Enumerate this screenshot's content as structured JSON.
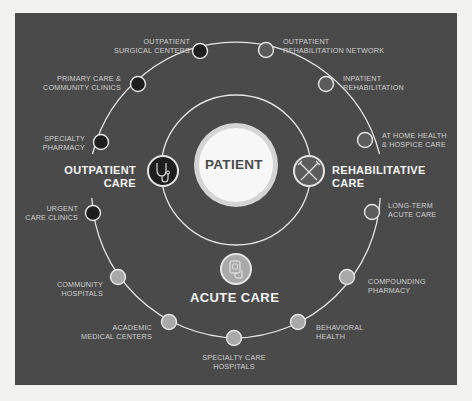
{
  "diagram": {
    "center": {
      "label": "PATIENT"
    },
    "categories": {
      "outpatient": {
        "line1": "OUTPATIENT",
        "line2": "CARE",
        "icon": "stethoscope-icon"
      },
      "rehabilitative": {
        "line1": "REHABILITATIVE",
        "line2": "CARE",
        "icon": "crutches-icon"
      },
      "acute": {
        "label": "ACUTE CARE",
        "icon": "iv-bag-icon"
      }
    },
    "nodes": [
      {
        "line1": "OUTPATIENT",
        "line2": "SURGICAL CENTERS",
        "group": "outpatient"
      },
      {
        "line1": "PRIMARY CARE &",
        "line2": "COMMUNITY CLINICS",
        "group": "outpatient"
      },
      {
        "line1": "SPECIALTY",
        "line2": "PHARMACY",
        "group": "outpatient"
      },
      {
        "line1": "URGENT",
        "line2": "CARE CLINICS",
        "group": "outpatient"
      },
      {
        "line1": "OUTPATIENT",
        "line2": "REHABILITATION NETWORK",
        "group": "rehabilitative"
      },
      {
        "line1": "INPATIENT",
        "line2": "REHABILITATION",
        "group": "rehabilitative"
      },
      {
        "line1": "AT HOME HEALTH",
        "line2": "& HOSPICE CARE",
        "group": "rehabilitative"
      },
      {
        "line1": "LONG-TERM",
        "line2": "ACUTE CARE",
        "group": "rehabilitative"
      },
      {
        "line1": "COMPOUNDING",
        "line2": "PHARMACY",
        "group": "acute"
      },
      {
        "line1": "BEHAVIORAL",
        "line2": "HEALTH",
        "group": "acute"
      },
      {
        "line1": "SPECIALTY CARE",
        "line2": "HOSPITALS",
        "group": "acute"
      },
      {
        "line1": "ACADEMIC",
        "line2": "MEDICAL CENTERS",
        "group": "acute"
      },
      {
        "line1": "COMMUNITY",
        "line2": "HOSPITALS",
        "group": "acute"
      }
    ],
    "colors": {
      "panel": "#4a4a4a",
      "ring": "#e6e6e6",
      "outpatient_node": "#1e1e1e",
      "rehabilitative_node": "#5a5a5a",
      "acute_node": "#a9a9a9",
      "patient_fill": "#f7f7f7",
      "patient_halo": "#d8d8d8"
    }
  }
}
